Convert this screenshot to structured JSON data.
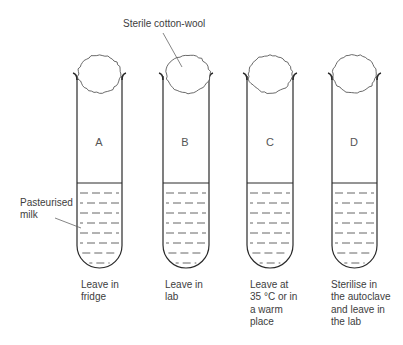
{
  "figure": {
    "top_label": "Sterile cotton-wool",
    "side_label": "Pasteurised\nmilk",
    "colors": {
      "stroke": "#2a2a2a",
      "text": "#3d3d3d",
      "background": "#ffffff"
    }
  },
  "tubes": [
    {
      "letter": "A",
      "caption": "Leave in\nfridge",
      "left": 77,
      "right": 122
    },
    {
      "letter": "B",
      "caption": "Leave in\nlab",
      "left": 163,
      "right": 209
    },
    {
      "letter": "C",
      "caption": "Leave at\n35 °C or in\na warm\nplace",
      "left": 247,
      "right": 293
    },
    {
      "letter": "D",
      "caption": "Sterilise in\nthe autoclave\nand leave in\nthe lab",
      "left": 332,
      "right": 377
    }
  ]
}
